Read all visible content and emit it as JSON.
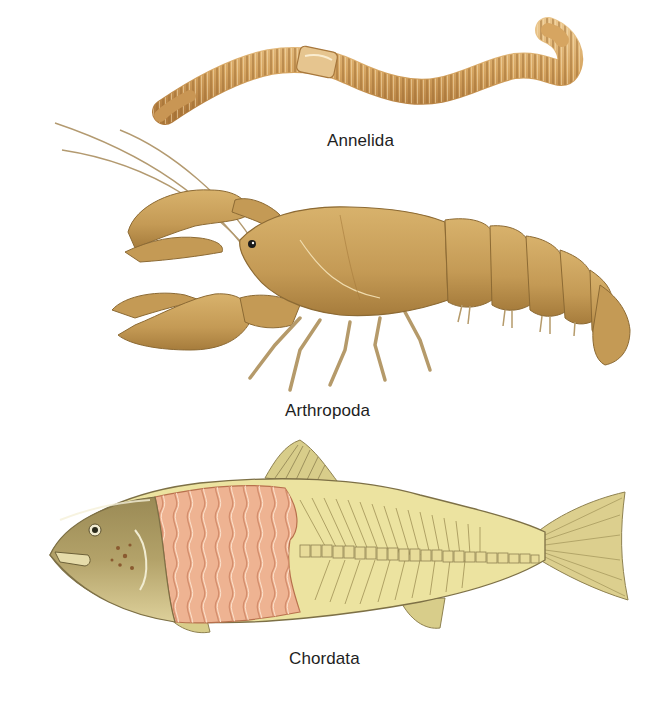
{
  "figure": {
    "panels": [
      {
        "id": "annelida",
        "label": "Annelida",
        "subject": "earthworm"
      },
      {
        "id": "arthropoda",
        "label": "Arthropoda",
        "subject": "crayfish"
      },
      {
        "id": "chordata",
        "label": "Chordata",
        "subject": "fish-cutaway-muscle-and-vertebrae"
      }
    ],
    "colors": {
      "background": "#ffffff",
      "worm_body": "#d6a561",
      "worm_ring": "#9c6d32",
      "worm_clitellum": "#e6c58f",
      "crayfish_body": "#c9a05a",
      "crayfish_shadow": "#a67c3c",
      "fish_body": "#ece3a0",
      "fish_head": "#b3a269",
      "fish_muscle": "#eeb392",
      "fish_muscle_line": "#d48d6c",
      "fish_vertebra": "#e8dc9a",
      "label_text": "#1e1e1e"
    }
  }
}
